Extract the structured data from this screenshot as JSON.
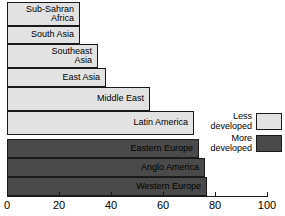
{
  "chart_data": {
    "type": "bar",
    "orientation": "horizontal",
    "title": "",
    "xlabel": "",
    "ylabel": "",
    "xlim": [
      0,
      100
    ],
    "grid": false,
    "categories": [
      "Sub-Sahran\nAfrica",
      "South Asia",
      "Southeast\nAsia",
      "East Asia",
      "Middle East",
      "Latin America",
      "Eastern Europe",
      "Anglo America",
      "Western Europe"
    ],
    "values": [
      28,
      28,
      35,
      38,
      55,
      72,
      74,
      76,
      77
    ],
    "series": [
      {
        "name": "Less developed",
        "color": "#e2e2e2",
        "points": [
          {
            "category": "Sub-Sahran\nAfrica",
            "value": 28
          },
          {
            "category": "South Asia",
            "value": 28
          },
          {
            "category": "Southeast\nAsia",
            "value": 35
          },
          {
            "category": "East Asia",
            "value": 38
          },
          {
            "category": "Middle East",
            "value": 55
          },
          {
            "category": "Latin America",
            "value": 72
          }
        ]
      },
      {
        "name": "More developed",
        "color": "#4a4a4a",
        "points": [
          {
            "category": "Eastern Europe",
            "value": 74
          },
          {
            "category": "Anglo America",
            "value": 76
          },
          {
            "category": "Western Europe",
            "value": 77
          }
        ]
      }
    ],
    "xticks": [
      0,
      20,
      40,
      60,
      80,
      100
    ],
    "xticklabels": [
      "0",
      "20",
      "40",
      "60",
      "80",
      "100"
    ],
    "legend": {
      "position": "right-middle",
      "entries": [
        {
          "label": "Less\ndeveloped",
          "color": "#e2e2e2"
        },
        {
          "label": "More\ndeveloped",
          "color": "#4a4a4a"
        }
      ]
    }
  },
  "bars": [
    {
      "label": "Sub-Sahran\nAfrica",
      "value": 28,
      "group": "less",
      "top": 2,
      "height": 24
    },
    {
      "label": "South Asia",
      "value": 28,
      "group": "less",
      "top": 26,
      "height": 18
    },
    {
      "label": "Southeast\nAsia",
      "value": 35,
      "group": "less",
      "top": 44,
      "height": 24
    },
    {
      "label": "East Asia",
      "value": 38,
      "group": "less",
      "top": 68,
      "height": 19
    },
    {
      "label": "Middle East",
      "value": 55,
      "group": "less",
      "top": 87,
      "height": 24
    },
    {
      "label": "Latin America",
      "value": 72,
      "group": "less",
      "top": 111,
      "height": 24
    },
    {
      "label": "Eastern Europe",
      "value": 74,
      "group": "more",
      "top": 139,
      "height": 19
    },
    {
      "label": "Anglo America",
      "value": 76,
      "group": "more",
      "top": 158,
      "height": 19
    },
    {
      "label": "Western Europe",
      "value": 77,
      "group": "more",
      "top": 177,
      "height": 19
    }
  ],
  "axis": {
    "ticks": [
      {
        "value": 0,
        "label": "0"
      },
      {
        "value": 20,
        "label": "20"
      },
      {
        "value": 40,
        "label": "40"
      },
      {
        "value": 60,
        "label": "60"
      },
      {
        "value": 80,
        "label": "80"
      },
      {
        "value": 100,
        "label": "100"
      }
    ]
  },
  "legend": {
    "entries": [
      {
        "label": "Less\ndeveloped",
        "group": "less"
      },
      {
        "label": "More\ndeveloped",
        "group": "more"
      }
    ]
  },
  "geometry": {
    "origin_x": 7,
    "px_per_unit": 2.6
  }
}
